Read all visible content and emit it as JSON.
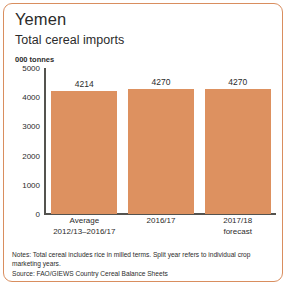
{
  "card": {
    "border_color": "#D98E5F",
    "background": "#FFFFFF"
  },
  "header": {
    "country": "Yemen",
    "subtitle": "Total cereal imports"
  },
  "footnotes": {
    "notes": "Notes: Total cereal includes rice in milled terms. Split year refers to individual crop marketing years.",
    "source": "Source: FAO/GIEWS Country Cereal Balance Sheets"
  },
  "chart_data": {
    "type": "bar",
    "title": "Total cereal imports",
    "subtitle": "Yemen",
    "xlabel": "",
    "ylabel": "000 tonnes",
    "unit_label": "000 tonnes",
    "categories": [
      "Average\n2012/13–2016/17",
      "2016/17",
      "2017/18\nforecast"
    ],
    "category_lines": [
      [
        "Average",
        "2012/13–2016/17"
      ],
      [
        "2016/17",
        ""
      ],
      [
        "2017/18",
        "forecast"
      ]
    ],
    "values": [
      4214,
      4270,
      4270
    ],
    "value_labels": [
      "4214",
      "4270",
      "4270"
    ],
    "ylim": [
      0,
      5000
    ],
    "yticks": [
      5000,
      4000,
      3000,
      2000,
      1000,
      0
    ],
    "ytick_labels": [
      "5000",
      "4000",
      "3000",
      "2000",
      "1000",
      "0"
    ],
    "grid": false,
    "legend": false,
    "bar_color": "#DD9160",
    "axis_color": "#54534F"
  }
}
